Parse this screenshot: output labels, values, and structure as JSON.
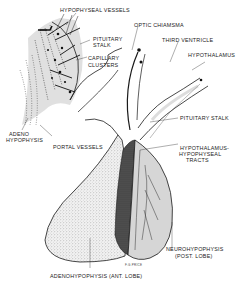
{
  "diagram": {
    "labels": {
      "hypophyseal_vessels": "HYPOPHYSEAL VESSELS",
      "optic_chiasma": "OPTIC CHIAMSMA",
      "pituitary_stalk_inset_1": "PITUITARY",
      "pituitary_stalk_inset_2": "STALK",
      "third_ventricle": "THIRD VENTRICLE",
      "capillary_clusters_1": "CAPILLARY",
      "capillary_clusters_2": "CLUSTERS",
      "hypothalamus": "HYPOTHALAMUS",
      "adeno_hypophysis_1": "ADENO",
      "adeno_hypophysis_2": "HYPOPHYSIS",
      "portal_vessels": "PORTAL VESSELS",
      "pituitary_stalk": "PITUITARY STALK",
      "tracts_1": "HYPOTHALAMUS-",
      "tracts_2": "HYPOPHYSEAL",
      "tracts_3": "TRACTS",
      "neurohypophysis_1": "NEUROHYPOPHYSIS",
      "neurohypophysis_2": "(POST. LOBE)",
      "adenohypophysis": "ADENOHYPOPHYSIS (ANT. LOBE)",
      "signature": "F.G.PRICE"
    },
    "colors": {
      "ink": "#1a1a1a",
      "stipple": "#9a9a9a",
      "light_fill": "#d6d6d6",
      "dark_band": "#3a3a3a"
    }
  }
}
